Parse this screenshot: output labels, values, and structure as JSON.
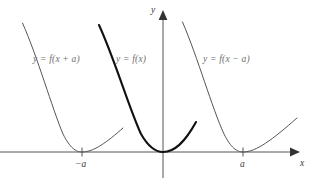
{
  "figure": {
    "background_color": "#ffffff",
    "width": 310,
    "height": 178
  },
  "axes": {
    "x_axis_label": "x",
    "y_axis_label": "y",
    "axis_color": "#555555",
    "origin_px": {
      "x": 163,
      "y": 152
    },
    "x_axis_y_px": 152,
    "y_axis_x_px": 163,
    "ticks": [
      {
        "label": "−a",
        "x_px": 82
      },
      {
        "label": "a",
        "x_px": 243
      }
    ]
  },
  "chart_data": {
    "type": "line",
    "xlabel": "x",
    "ylabel": "y",
    "grid": false,
    "legend": "inline-labels",
    "xlim": [
      -2.05,
      1.75
    ],
    "ylim": [
      0,
      1.45
    ],
    "annotations": [
      {
        "text": "y = f(x + a)",
        "x_px": 33,
        "y_px": 62
      },
      {
        "text": "y = f(x)",
        "x_px": 116,
        "y_px": 62
      },
      {
        "text": "y = f(x − a)",
        "x_px": 203,
        "y_px": 62
      }
    ],
    "tick_labels_x": [
      "−a",
      "a"
    ],
    "series": [
      {
        "name": "y = f(x + a)",
        "style": "thin",
        "color": "#555555",
        "linewidth": 1.0,
        "vertex_px": {
          "x": 82,
          "y": 152
        },
        "shift": "left by a",
        "path": "M 22.5,23 C 38,58 52,108 63,134 C 70,148 76,152 82,152 C 94,152 107,142 123,128",
        "tail_path": "M 82,152 C 95,150 110,140 123,128"
      },
      {
        "name": "y = f(x)",
        "style": "bold",
        "color": "#111111",
        "linewidth": 2.1,
        "vertex_px": {
          "x": 163,
          "y": 152
        },
        "shift": "none",
        "path": "M 99,25 C 115,60 129,108 141,134 C 149,148 156,152 163,152 C 175,152 185,142 196,122",
        "tail_path": "M 163,152 C 176,150 187,139 196,122"
      },
      {
        "name": "y = f(x − a)",
        "style": "thin",
        "color": "#555555",
        "linewidth": 1.0,
        "vertex_px": {
          "x": 243,
          "y": 152
        },
        "shift": "right by a",
        "path": "M 182.5,22 C 198,58 212,108 224,134 C 231,148 237,152 243,152 C 256,152 272,140 297,118",
        "tail_path": "M 243,152 C 258,150 275,138 297,118"
      }
    ]
  }
}
